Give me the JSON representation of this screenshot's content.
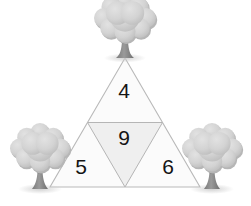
{
  "diagram": {
    "type": "geometric-figure",
    "background_color": "#ffffff",
    "outline_color": "#b9b9b9",
    "triangle": {
      "apex": [
        125,
        58
      ],
      "base_left": [
        50,
        187
      ],
      "base_right": [
        200,
        187
      ],
      "fill_outer": "#fbfbfb",
      "fill_inner": "#efefef"
    },
    "regions": [
      {
        "name": "top",
        "value": "4",
        "position": "upper-center",
        "orientation": "upright"
      },
      {
        "name": "middle",
        "value": "9",
        "position": "center",
        "orientation": "inverted"
      },
      {
        "name": "bottom-left",
        "value": "5",
        "position": "lower-left",
        "orientation": "upright"
      },
      {
        "name": "bottom-right",
        "value": "6",
        "position": "lower-right",
        "orientation": "upright"
      }
    ],
    "values": [
      4,
      9,
      5,
      6
    ],
    "trees": [
      {
        "name": "top-tree",
        "anchor": [
          125,
          58
        ],
        "canopy_color": "#d4d4d4",
        "trunk_color": "#8e8e8e"
      },
      {
        "name": "left-tree",
        "anchor": [
          40,
          187
        ],
        "canopy_color": "#d4d4d4",
        "trunk_color": "#8e8e8e"
      },
      {
        "name": "right-tree",
        "anchor": [
          212,
          187
        ],
        "canopy_color": "#d4d4d4",
        "trunk_color": "#8e8e8e"
      }
    ]
  }
}
